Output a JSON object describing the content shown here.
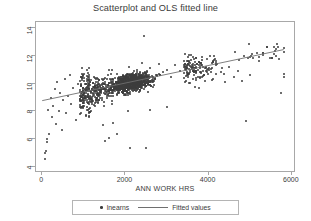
{
  "chart_data": {
    "type": "scatter",
    "title": "Scatterplot and OLS fitted line",
    "xlabel": "ANN WORK HRS",
    "ylabel": "",
    "xlim": [
      -150,
      6100
    ],
    "ylim": [
      3.6,
      14.4
    ],
    "xticks": [
      "0",
      "2000",
      "4000",
      "6000"
    ],
    "xtick_values": [
      0,
      2000,
      4000,
      6000
    ],
    "yticks": [
      "4",
      "6",
      "8",
      "10",
      "12",
      "14"
    ],
    "ytick_values": [
      4,
      6,
      8,
      10,
      12,
      14
    ],
    "grid": false,
    "legend_position": "bottom",
    "series": [
      {
        "name": "lnearns",
        "type": "scatter",
        "marker": "dot",
        "color": "#3d3d3d",
        "n_points": 1400,
        "description": "Log annual earnings versus annual work hours; dense cloud centred near 2200 hours and 10.3 log earnings with a positive slope and wide scatter at low hours.",
        "x_mean": 2100,
        "y_mean": 10.1,
        "sample_points": [
          [
            60,
            4.6
          ],
          [
            70,
            5.0
          ],
          [
            90,
            5.2
          ],
          [
            110,
            5.8
          ],
          [
            120,
            6.0
          ],
          [
            150,
            8.1
          ],
          [
            170,
            6.4
          ],
          [
            200,
            9.0
          ],
          [
            230,
            7.6
          ],
          [
            260,
            8.4
          ],
          [
            300,
            9.6
          ],
          [
            330,
            7.1
          ],
          [
            360,
            10.1
          ],
          [
            400,
            8.0
          ],
          [
            430,
            9.3
          ],
          [
            470,
            6.7
          ],
          [
            500,
            8.8
          ],
          [
            540,
            10.3
          ],
          [
            580,
            7.9
          ],
          [
            620,
            9.1
          ],
          [
            660,
            10.6
          ],
          [
            700,
            8.5
          ],
          [
            750,
            9.7
          ],
          [
            800,
            7.4
          ],
          [
            850,
            10.0
          ],
          [
            900,
            9.4
          ],
          [
            950,
            8.3
          ],
          [
            1000,
            10.2
          ],
          [
            1050,
            9.0
          ],
          [
            1100,
            10.5
          ],
          [
            1200,
            9.6
          ],
          [
            1300,
            10.1
          ],
          [
            1400,
            9.2
          ],
          [
            1500,
            10.4
          ],
          [
            1600,
            11.0
          ],
          [
            1700,
            10.0
          ],
          [
            1800,
            10.7
          ],
          [
            1900,
            9.8
          ],
          [
            2000,
            10.5
          ],
          [
            2080,
            11.2
          ],
          [
            2150,
            10.2
          ],
          [
            2200,
            10.9
          ],
          [
            2300,
            10.4
          ],
          [
            2400,
            11.5
          ],
          [
            2450,
            13.4
          ],
          [
            2500,
            10.6
          ],
          [
            2600,
            11.1
          ],
          [
            2700,
            10.3
          ],
          [
            2800,
            11.4
          ],
          [
            2900,
            10.8
          ],
          [
            3000,
            11.0
          ],
          [
            3100,
            10.5
          ],
          [
            3200,
            11.3
          ],
          [
            3300,
            10.9
          ],
          [
            3400,
            11.6
          ],
          [
            3500,
            10.7
          ],
          [
            3600,
            11.2
          ],
          [
            3700,
            10.4
          ],
          [
            3800,
            11.5
          ],
          [
            3900,
            10.6
          ],
          [
            4000,
            11.0
          ],
          [
            4100,
            10.3
          ],
          [
            4200,
            11.4
          ],
          [
            4300,
            10.8
          ],
          [
            4400,
            10.1
          ],
          [
            4500,
            11.2
          ],
          [
            4600,
            10.5
          ],
          [
            4700,
            10.9
          ],
          [
            4800,
            10.2
          ],
          [
            4900,
            7.3
          ],
          [
            5000,
            10.6
          ],
          [
            5750,
            9.3
          ],
          [
            5800,
            10.5
          ],
          [
            5810,
            10.7
          ],
          [
            1500,
            5.9
          ],
          [
            1600,
            6.1
          ],
          [
            1800,
            6.4
          ],
          [
            2100,
            5.4
          ],
          [
            2500,
            5.4
          ],
          [
            1450,
            7.0
          ],
          [
            1700,
            7.2
          ],
          [
            2050,
            8.0
          ],
          [
            2600,
            8.1
          ],
          [
            3000,
            8.3
          ]
        ]
      },
      {
        "name": "Fitted values",
        "type": "line",
        "color": "#6f6f6f",
        "x_start": 0,
        "y_start": 8.7,
        "x_end": 5850,
        "y_end": 12.4,
        "intercept": 8.7,
        "slope": 0.000633
      }
    ]
  },
  "legend": {
    "entries": [
      {
        "label": "lnearns",
        "marker": "dot"
      },
      {
        "label": "Fitted values",
        "marker": "line"
      }
    ]
  },
  "colors": {
    "marker": "#3d3d3d",
    "fit_line": "#6f6f6f",
    "frame": "#a8a8a8",
    "text": "#3a3a3a",
    "background": "#ffffff"
  }
}
